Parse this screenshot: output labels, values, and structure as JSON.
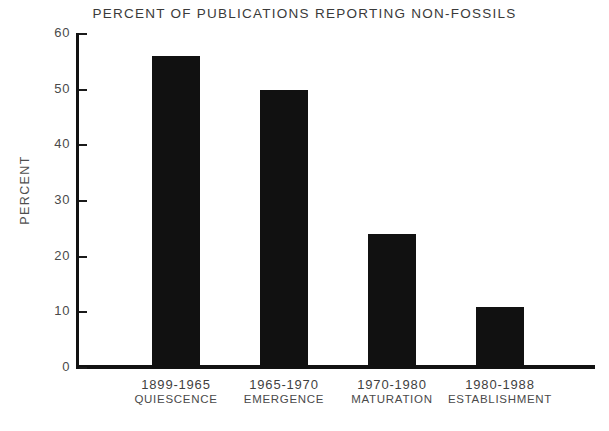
{
  "chart_data": {
    "type": "bar",
    "title": "PERCENT OF PUBLICATIONS REPORTING NON-FOSSILS",
    "xlabel": "",
    "ylabel": "PERCENT",
    "categories": [
      "1899-1965",
      "1965-1970",
      "1970-1980",
      "1980-1988"
    ],
    "category_sublabels": [
      "QUIESCENCE",
      "EMERGENCE",
      "MATURATION",
      "ESTABLISHMENT"
    ],
    "values": [
      56,
      50,
      24,
      11
    ],
    "ylim": [
      0,
      60
    ],
    "yticks": [
      0,
      10,
      20,
      30,
      40,
      50,
      60
    ],
    "ytick_labels": [
      "0",
      "10",
      "20",
      "30",
      "40",
      "50",
      "60"
    ],
    "grid": false,
    "legend": false,
    "bar_color": "#111111",
    "axis_color": "#121212",
    "text_color": "#3f3f3f"
  }
}
